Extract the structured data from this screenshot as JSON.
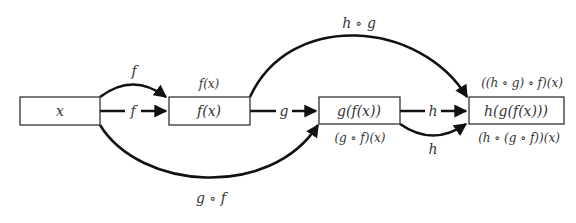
{
  "diagram": {
    "nodes": [
      {
        "id": "x",
        "label": "x"
      },
      {
        "id": "fx",
        "label": "f(x)",
        "above": "f(x)"
      },
      {
        "id": "gfx",
        "label": "g(f(x))",
        "below": "(g ∘ f)(x)"
      },
      {
        "id": "hgfx",
        "label": "h(g(f(x)))",
        "above": "((h ∘ g) ∘ f)(x)",
        "below": "(h ∘ (g ∘ f))(x)"
      }
    ],
    "edges": [
      {
        "from": "x",
        "to": "fx",
        "label": "f",
        "style": "straight"
      },
      {
        "from": "x",
        "to": "fx",
        "label": "f",
        "style": "arc-above"
      },
      {
        "from": "fx",
        "to": "gfx",
        "label": "g",
        "style": "straight"
      },
      {
        "from": "x",
        "to": "gfx",
        "label": "g ∘ f",
        "style": "arc-below"
      },
      {
        "from": "gfx",
        "to": "hgfx",
        "label": "h",
        "style": "straight"
      },
      {
        "from": "gfx",
        "to": "hgfx",
        "label": "h",
        "style": "arc-below"
      },
      {
        "from": "fx",
        "to": "hgfx",
        "label": "h ∘ g",
        "style": "arc-above"
      }
    ]
  }
}
